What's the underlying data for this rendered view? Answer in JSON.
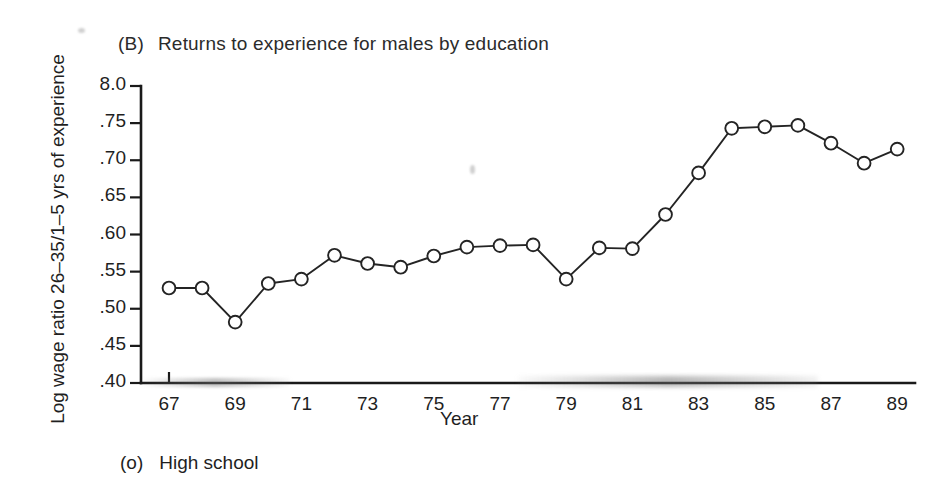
{
  "figure": {
    "panel_tag": "(B)",
    "panel_title": "Returns to experience for males by education",
    "legend_symbol": "(o)",
    "legend_label": "High school",
    "ink_color": "#242424"
  },
  "chart_data": {
    "type": "line",
    "xlabel": "Year",
    "ylabel": "Log wage ratio 26–35/1–5 yrs of experience",
    "xlim": [
      66,
      90
    ],
    "ylim": [
      0.4,
      0.8
    ],
    "grid": false,
    "legend_position": "below-axes",
    "xtick_labels": [
      "67",
      "69",
      "71",
      "73",
      "75",
      "77",
      "79",
      "81",
      "83",
      "85",
      "87",
      "89"
    ],
    "xtick_values": [
      67,
      69,
      71,
      73,
      75,
      77,
      79,
      81,
      83,
      85,
      87,
      89
    ],
    "ytick_labels": [
      "8.0",
      ".75",
      ".70",
      ".65",
      ".60",
      ".55",
      ".50",
      ".45",
      ".40"
    ],
    "ytick_values": [
      0.8,
      0.75,
      0.7,
      0.65,
      0.6,
      0.55,
      0.5,
      0.45,
      0.4
    ],
    "series": [
      {
        "name": "High school",
        "marker": "open-circle",
        "x": [
          67,
          68,
          69,
          70,
          71,
          72,
          73,
          74,
          75,
          76,
          77,
          78,
          79,
          80,
          81,
          82,
          83,
          84,
          85,
          86,
          87,
          88,
          89
        ],
        "values": [
          0.528,
          0.528,
          0.482,
          0.534,
          0.54,
          0.572,
          0.561,
          0.556,
          0.571,
          0.583,
          0.585,
          0.586,
          0.54,
          0.582,
          0.581,
          0.627,
          0.683,
          0.743,
          0.745,
          0.747,
          0.723,
          0.696,
          0.715
        ]
      }
    ]
  }
}
